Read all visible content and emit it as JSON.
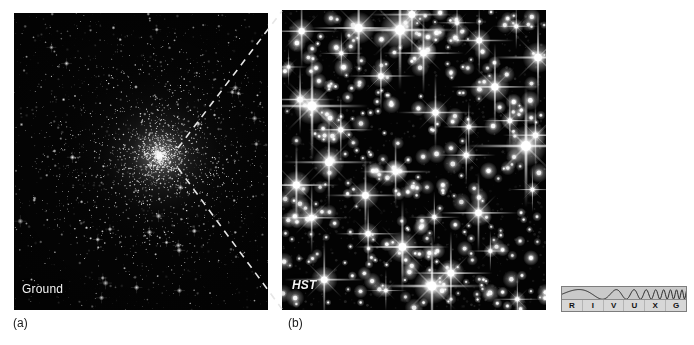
{
  "figure": {
    "background_color": "#ffffff",
    "panels": [
      {
        "id": "ground",
        "caption": "(a)",
        "tag": "Ground",
        "tag_style": "upright",
        "description": "Ground-based telescope image of a globular star cluster; dense unresolved core of stars at center fading outward into a crowded star field.",
        "background_color": "#050505"
      },
      {
        "id": "hst",
        "caption": "(b)",
        "tag": "HST",
        "tag_style": "italic",
        "description": "Hubble Space Telescope close-up of the cluster core showing individually resolved bright stars with diffraction spikes.",
        "background_color": "#030303"
      }
    ],
    "connector": {
      "name": "zoom-callout-dashed-lines",
      "style": "dashed",
      "color": "#e8e8e8",
      "description": "Two dashed lines fanning from the ground-based cluster core out to the top-left and bottom-left corners of the HST panel."
    }
  },
  "spectrum_key": {
    "name": "RIVUXG electromagnetic spectrum key",
    "bands": [
      {
        "letter": "R",
        "name": "radio",
        "highlighted": false
      },
      {
        "letter": "I",
        "name": "infrared",
        "highlighted": false
      },
      {
        "letter": "V",
        "name": "visible",
        "highlighted": true
      },
      {
        "letter": "U",
        "name": "ultraviolet",
        "highlighted": false
      },
      {
        "letter": "X",
        "name": "x-ray",
        "highlighted": false
      },
      {
        "letter": "G",
        "name": "gamma-ray",
        "highlighted": false
      }
    ],
    "background_color": "#c9c9c9",
    "letter_row_color": "#d7d7d7",
    "border_color": "#7d7d7d",
    "wave_color": "#1a1a1a"
  },
  "chart_data": {
    "type": "scatter",
    "title": "",
    "subtitle": "",
    "xlabel": "",
    "ylabel": "",
    "series": [
      {
        "name": "ground-based star field",
        "panel": "ground",
        "star_count_estimate": 2600,
        "core_center_fraction": [
          0.575,
          0.48
        ],
        "core_radius_fraction": 0.22,
        "halo_radius_fraction": 0.62
      },
      {
        "name": "HST resolved stars",
        "panel": "hst",
        "star_count_estimate": 420,
        "bright_star_count_estimate": 34,
        "diffraction_spikes": true
      }
    ]
  }
}
